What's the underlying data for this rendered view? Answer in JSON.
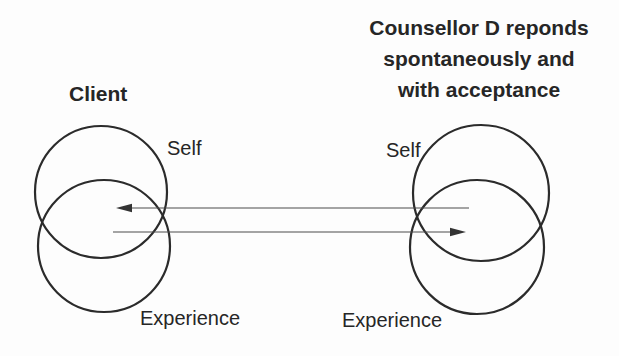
{
  "diagram": {
    "client": {
      "title": "Client",
      "self_label": "Self",
      "experience_label": "Experience"
    },
    "counsellor": {
      "title_lines": [
        "Counsellor D reponds",
        "spontaneously and",
        "with acceptance"
      ],
      "self_label": "Self",
      "experience_label": "Experience"
    },
    "arrows": [
      {
        "name": "counsellor-to-client",
        "direction": "left"
      },
      {
        "name": "client-to-counsellor",
        "direction": "right"
      }
    ],
    "colors": {
      "text": "#262626",
      "circle_stroke": "#2b2b2b",
      "arrow_line": "#4d4d4d",
      "arrow_head": "#333333",
      "background": "#fdfdfd"
    }
  }
}
